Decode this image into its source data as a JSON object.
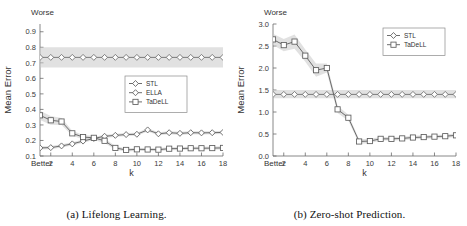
{
  "figure": {
    "panels": [
      {
        "id": "a",
        "caption": "(a) Lifelong Learning.",
        "corner_top": "Worse",
        "corner_bottom": "Better"
      },
      {
        "id": "b",
        "caption": "(b) Zero-shot Prediction.",
        "corner_top": "Worse",
        "corner_bottom": "Better"
      }
    ]
  },
  "chart_data": [
    {
      "type": "line",
      "title": "(a) Lifelong Learning.",
      "xlabel": "k",
      "ylabel": "Mean Error",
      "xlim": [
        1,
        18
      ],
      "ylim": [
        0.1,
        0.95
      ],
      "xticks": [
        2,
        4,
        6,
        8,
        10,
        12,
        14,
        16,
        18
      ],
      "yticks": [
        0.1,
        0.2,
        0.3,
        0.4,
        0.5,
        0.6,
        0.7,
        0.8,
        0.9
      ],
      "grid": false,
      "legend_position": "center-right",
      "annotations": {
        "top_left": "Worse",
        "bottom_left": "Better"
      },
      "x": [
        1,
        2,
        3,
        4,
        5,
        6,
        7,
        8,
        9,
        10,
        11,
        12,
        13,
        14,
        15,
        16,
        17,
        18
      ],
      "series": [
        {
          "name": "STL",
          "marker": "diamond",
          "color": "#6f6f6f",
          "values": [
            0.735,
            0.735,
            0.735,
            0.735,
            0.735,
            0.735,
            0.735,
            0.735,
            0.735,
            0.735,
            0.735,
            0.735,
            0.735,
            0.735,
            0.735,
            0.735,
            0.735,
            0.735
          ],
          "band_upper": [
            0.8,
            0.8,
            0.8,
            0.8,
            0.8,
            0.8,
            0.8,
            0.8,
            0.8,
            0.8,
            0.8,
            0.8,
            0.8,
            0.8,
            0.8,
            0.8,
            0.8,
            0.8
          ],
          "band_lower": [
            0.67,
            0.67,
            0.67,
            0.67,
            0.67,
            0.67,
            0.67,
            0.67,
            0.67,
            0.67,
            0.67,
            0.67,
            0.67,
            0.67,
            0.67,
            0.67,
            0.67,
            0.67
          ]
        },
        {
          "name": "ELLA",
          "marker": "diamond",
          "color": "#5d5d5d",
          "values": [
            0.152,
            0.154,
            0.165,
            0.178,
            0.196,
            0.213,
            0.227,
            0.233,
            0.238,
            0.24,
            0.268,
            0.243,
            0.25,
            0.246,
            0.25,
            0.249,
            0.25,
            0.252
          ],
          "band_upper": [
            0.162,
            0.164,
            0.175,
            0.188,
            0.206,
            0.223,
            0.237,
            0.243,
            0.248,
            0.25,
            0.278,
            0.253,
            0.26,
            0.256,
            0.26,
            0.259,
            0.26,
            0.262
          ],
          "band_lower": [
            0.142,
            0.144,
            0.155,
            0.168,
            0.186,
            0.203,
            0.217,
            0.223,
            0.228,
            0.23,
            0.258,
            0.233,
            0.24,
            0.236,
            0.24,
            0.239,
            0.24,
            0.242
          ]
        },
        {
          "name": "TaDeLL",
          "marker": "square",
          "color": "#5d5d5d",
          "values": [
            0.362,
            0.33,
            0.322,
            0.246,
            0.222,
            0.217,
            0.198,
            0.152,
            0.139,
            0.143,
            0.142,
            0.141,
            0.147,
            0.148,
            0.15,
            0.15,
            0.151,
            0.152
          ],
          "band_upper": [
            0.392,
            0.358,
            0.344,
            0.262,
            0.236,
            0.231,
            0.212,
            0.164,
            0.149,
            0.153,
            0.152,
            0.151,
            0.157,
            0.158,
            0.16,
            0.16,
            0.161,
            0.162
          ],
          "band_lower": [
            0.332,
            0.302,
            0.3,
            0.23,
            0.208,
            0.203,
            0.184,
            0.14,
            0.129,
            0.133,
            0.132,
            0.131,
            0.137,
            0.138,
            0.14,
            0.14,
            0.141,
            0.142
          ]
        }
      ]
    },
    {
      "type": "line",
      "title": "(b) Zero-shot Prediction.",
      "xlabel": "k",
      "ylabel": "Mean Error",
      "xlim": [
        1,
        18
      ],
      "ylim": [
        0.0,
        3.0
      ],
      "xticks": [
        2,
        4,
        6,
        8,
        10,
        12,
        14,
        16,
        18
      ],
      "yticks": [
        0.0,
        0.5,
        1.0,
        1.5,
        2.0,
        2.5,
        3.0
      ],
      "grid": false,
      "legend_position": "top-right",
      "annotations": {
        "top_left": "Worse",
        "bottom_left": "Better"
      },
      "x": [
        1,
        2,
        3,
        4,
        5,
        6,
        7,
        8,
        9,
        10,
        11,
        12,
        13,
        14,
        15,
        16,
        17,
        18
      ],
      "series": [
        {
          "name": "STL",
          "marker": "diamond",
          "color": "#6f6f6f",
          "values": [
            1.4,
            1.4,
            1.4,
            1.4,
            1.4,
            1.4,
            1.4,
            1.4,
            1.4,
            1.4,
            1.4,
            1.4,
            1.4,
            1.4,
            1.4,
            1.4,
            1.4,
            1.4
          ],
          "band_upper": [
            1.5,
            1.5,
            1.5,
            1.5,
            1.5,
            1.5,
            1.5,
            1.5,
            1.5,
            1.5,
            1.5,
            1.5,
            1.5,
            1.5,
            1.5,
            1.5,
            1.5,
            1.5
          ],
          "band_lower": [
            1.31,
            1.31,
            1.31,
            1.31,
            1.31,
            1.31,
            1.31,
            1.31,
            1.31,
            1.31,
            1.31,
            1.31,
            1.31,
            1.31,
            1.31,
            1.31,
            1.31,
            1.31
          ]
        },
        {
          "name": "TaDeLL",
          "marker": "square",
          "color": "#5d5d5d",
          "values": [
            2.65,
            2.52,
            2.6,
            2.28,
            1.95,
            2.0,
            1.06,
            0.87,
            0.33,
            0.34,
            0.39,
            0.39,
            0.4,
            0.42,
            0.43,
            0.44,
            0.45,
            0.47
          ],
          "band_upper": [
            2.78,
            2.66,
            2.76,
            2.42,
            2.1,
            2.1,
            1.14,
            0.94,
            0.38,
            0.39,
            0.43,
            0.43,
            0.44,
            0.46,
            0.47,
            0.48,
            0.49,
            0.51
          ],
          "band_lower": [
            2.52,
            2.38,
            2.44,
            2.14,
            1.8,
            1.9,
            0.98,
            0.8,
            0.28,
            0.29,
            0.35,
            0.35,
            0.36,
            0.38,
            0.39,
            0.4,
            0.41,
            0.43
          ]
        }
      ]
    }
  ],
  "legends": {
    "panel_a": [
      {
        "label": "STL",
        "marker": "diamond"
      },
      {
        "label": "ELLA",
        "marker": "diamond"
      },
      {
        "label": "TaDeLL",
        "marker": "square"
      }
    ],
    "panel_b": [
      {
        "label": "STL",
        "marker": "diamond"
      },
      {
        "label": "TaDeLL",
        "marker": "square"
      }
    ]
  },
  "colors": {
    "axis": "#6b6b6b",
    "line": "#5d5d5d",
    "band": "#c9c9c9",
    "text": "#333333",
    "background": "#ffffff"
  }
}
